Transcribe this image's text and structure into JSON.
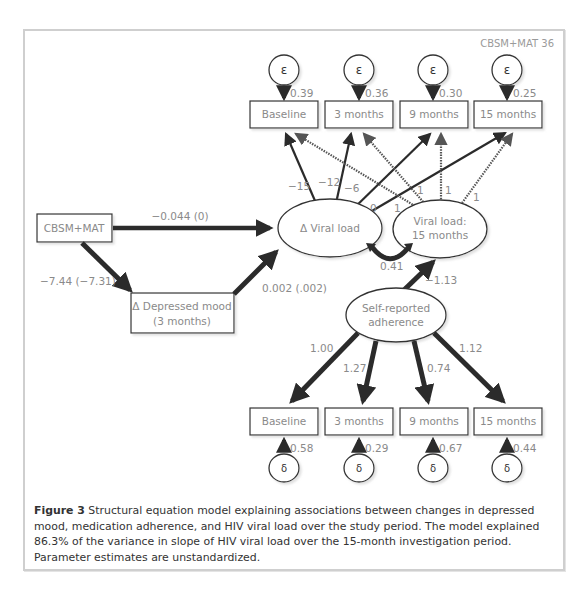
{
  "figure": {
    "corner_label": "CBSM+MAT 36",
    "caption_label": "Figure 3",
    "caption_text": "  Structural equation model explaining associations between changes in depressed mood, medication adherence, and HIV viral load over the study period. The model explained 86.3% of the variance in slope of HIV viral load over the 15-month investigation period. Parameter estimates are unstandardized."
  },
  "nodes": {
    "cbsm": "CBSM+MAT",
    "depressed_mood_line1": "Δ Depressed mood",
    "depressed_mood_line2": "(3 months)",
    "delta_viral_load": "Δ Viral load",
    "viral_load_15_line1": "Viral load:",
    "viral_load_15_line2": "15 months",
    "adherence_line1": "Self-reported",
    "adherence_line2": "adherence",
    "top_indicators": [
      "Baseline",
      "3 months",
      "9 months",
      "15 months"
    ],
    "bottom_indicators": [
      "Baseline",
      "3 months",
      "9 months",
      "15 months"
    ],
    "epsilon_symbol": "ε",
    "delta_symbol": "δ"
  },
  "paths": {
    "cbsm_to_dvl": "−0.044 (0)",
    "cbsm_to_mood": "−7.44 (−7.31)",
    "mood_to_dvl": "0.002 (.002)",
    "dvl_vl15_cov": "0.41",
    "adherence_to_vl15": "−1.13",
    "dvl_loadings": [
      "−15",
      "−12",
      "−6",
      "0"
    ],
    "vl15_loadings": [
      "1",
      "1",
      "1",
      "1"
    ],
    "epsilon_errors": [
      "0.39",
      "0.36",
      "0.30",
      "0.25"
    ],
    "adherence_loadings": [
      "1.00",
      "1.27",
      "0.74",
      "1.12"
    ],
    "delta_errors": [
      "0.58",
      "0.29",
      "0.67",
      "0.44"
    ]
  }
}
